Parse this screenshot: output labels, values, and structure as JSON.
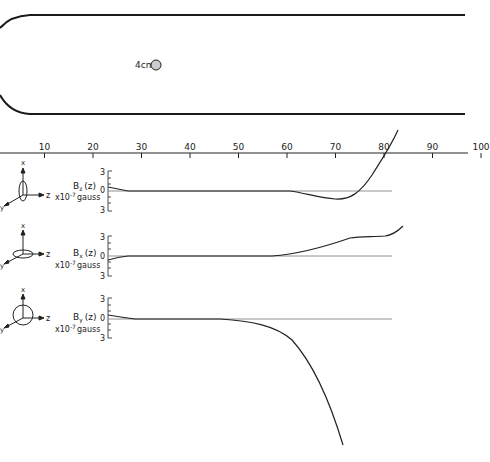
{
  "chamber": {
    "probe_label": "4cm"
  },
  "z_axis": {
    "ticks": [
      "10",
      "20",
      "30",
      "40",
      "50",
      "60",
      "70",
      "80",
      "90",
      "100"
    ]
  },
  "panels": [
    {
      "component": "z",
      "label_main": "B",
      "label_sub": "z",
      "label_arg": "(z)",
      "unit_prefix": "x10",
      "unit_exp": "-7",
      "unit": "gauss",
      "tick_top": "3",
      "tick_zero": "0",
      "tick_bottom": "3",
      "axes_icon": {
        "up": "x",
        "right": "z",
        "diag": "y"
      }
    },
    {
      "component": "x",
      "label_main": "B",
      "label_sub": "x",
      "label_arg": "(z)",
      "unit_prefix": "x10",
      "unit_exp": "-7",
      "unit": "gauss",
      "tick_top": "3",
      "tick_zero": "0",
      "tick_bottom": "3",
      "axes_icon": {
        "up": "x",
        "right": "z",
        "diag": "y"
      }
    },
    {
      "component": "y",
      "label_main": "B",
      "label_sub": "y",
      "label_arg": "(z)",
      "unit_prefix": "x10",
      "unit_exp": "-7",
      "unit": "gauss",
      "tick_top": "3",
      "tick_zero": "0",
      "tick_bottom": "3",
      "axes_icon": {
        "up": "x",
        "right": "z",
        "diag": "y"
      }
    }
  ],
  "chart_data": {
    "type": "line",
    "title": "",
    "xlabel": "z",
    "x_ticks": [
      10,
      20,
      30,
      40,
      50,
      60,
      70,
      80,
      90,
      100
    ],
    "xlim": [
      0,
      100
    ],
    "grid": false,
    "series": [
      {
        "name": "Bz(z)",
        "unit": "x10^-7 gauss",
        "ylim": [
          -3,
          3
        ],
        "points": [
          [
            8,
            0.3
          ],
          [
            12,
            0.05
          ],
          [
            20,
            0
          ],
          [
            40,
            0
          ],
          [
            60,
            0
          ],
          [
            66,
            -0.4
          ],
          [
            72,
            -0.8
          ],
          [
            76,
            -0.5
          ],
          [
            80,
            1.0
          ],
          [
            84,
            4.0
          ],
          [
            86,
            6.5
          ]
        ]
      },
      {
        "name": "Bx(z)",
        "unit": "x10^-7 gauss",
        "ylim": [
          -3,
          3
        ],
        "points": [
          [
            8,
            -0.4
          ],
          [
            12,
            -0.1
          ],
          [
            20,
            0
          ],
          [
            40,
            0
          ],
          [
            60,
            0.1
          ],
          [
            66,
            0.8
          ],
          [
            72,
            1.6
          ],
          [
            78,
            2.2
          ],
          [
            82,
            2.3
          ],
          [
            85,
            2.8
          ],
          [
            87,
            3.6
          ]
        ]
      },
      {
        "name": "By(z)",
        "unit": "x10^-7 gauss",
        "ylim": [
          -3,
          3
        ],
        "points": [
          [
            8,
            0.4
          ],
          [
            14,
            0.1
          ],
          [
            20,
            0
          ],
          [
            40,
            0
          ],
          [
            50,
            -0.3
          ],
          [
            60,
            -1.3
          ],
          [
            66,
            -3.5
          ],
          [
            72,
            -9.0
          ],
          [
            76,
            -17.0
          ],
          [
            78,
            -24.0
          ]
        ]
      }
    ],
    "annotations": [
      "4cm"
    ]
  }
}
